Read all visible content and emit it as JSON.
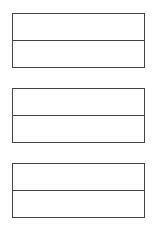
{
  "diagram": {
    "type": "stacked-boxes",
    "stroke_color": "#444444",
    "background_color": "#ffffff",
    "boxes": [
      {
        "cells": [
          {
            "text": ""
          },
          {
            "text": ""
          }
        ]
      },
      {
        "cells": [
          {
            "text": ""
          },
          {
            "text": ""
          }
        ]
      },
      {
        "cells": [
          {
            "text": ""
          },
          {
            "text": ""
          }
        ]
      }
    ]
  }
}
